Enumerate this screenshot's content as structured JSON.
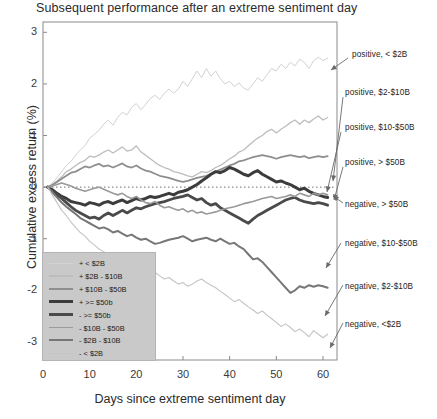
{
  "chart_data": {
    "type": "line",
    "title": "Subsequent performance after an extreme sentiment day",
    "xlabel": "Days since extreme sentiment day",
    "ylabel": "Cumulative excess return (%)",
    "xlim": [
      0,
      63
    ],
    "ylim": [
      -3.35,
      3.2
    ],
    "xticks": [
      0,
      10,
      20,
      30,
      40,
      50,
      60
    ],
    "xtick_labels": [
      "0",
      "10",
      "20",
      "30",
      "40",
      "50",
      "60"
    ],
    "yticks": [
      3,
      2,
      1,
      0,
      -1,
      -2,
      -3
    ],
    "ytick_labels": [
      "3",
      "2",
      "1",
      "0",
      "-1",
      "-2",
      "-3"
    ],
    "grid": false,
    "zero_reference_line": 0,
    "legend_position": "lower-left-inside",
    "x": [
      1,
      2,
      3,
      4,
      5,
      6,
      7,
      8,
      9,
      10,
      11,
      12,
      13,
      14,
      15,
      16,
      17,
      18,
      19,
      20,
      21,
      22,
      23,
      24,
      25,
      26,
      27,
      28,
      29,
      30,
      31,
      32,
      33,
      34,
      35,
      36,
      37,
      38,
      39,
      40,
      41,
      42,
      43,
      44,
      45,
      46,
      47,
      48,
      49,
      50,
      51,
      52,
      53,
      54,
      55,
      56,
      57,
      58,
      59,
      60,
      61
    ],
    "series": [
      {
        "name": "positive, < $2B",
        "legend_label": "+  < $2B",
        "color": "#d2d2d2",
        "width": 1.0,
        "sign": "positive",
        "bucket": "< $2B",
        "final_value": 2.5,
        "values": [
          0,
          0.08,
          0.18,
          0.3,
          0.42,
          0.5,
          0.62,
          0.72,
          0.8,
          0.95,
          1.02,
          1.1,
          1.22,
          1.3,
          1.2,
          1.35,
          1.45,
          1.4,
          1.55,
          1.62,
          1.5,
          1.6,
          1.72,
          1.78,
          1.7,
          1.82,
          1.9,
          1.82,
          1.9,
          2.05,
          1.95,
          2.1,
          2.25,
          2.12,
          2.3,
          2.15,
          2.25,
          2.1,
          2.0,
          2.05,
          1.95,
          2.02,
          1.92,
          1.88,
          2.0,
          2.12,
          2.05,
          2.18,
          2.3,
          2.25,
          2.38,
          2.3,
          2.42,
          2.35,
          2.48,
          2.42,
          2.3,
          2.45,
          2.52,
          2.45,
          2.5
        ]
      },
      {
        "name": "positive, $2-$10B",
        "legend_label": "+  $2B - $10B",
        "color": "#bdbdbd",
        "width": 1.3,
        "sign": "positive",
        "bucket": "$2B - $10B",
        "final_value": 1.35,
        "values": [
          0,
          0.05,
          0.12,
          0.2,
          0.3,
          0.35,
          0.42,
          0.48,
          0.52,
          0.6,
          0.58,
          0.62,
          0.68,
          0.72,
          0.66,
          0.72,
          0.78,
          0.7,
          0.72,
          0.8,
          0.68,
          0.62,
          0.55,
          0.48,
          0.42,
          0.38,
          0.35,
          0.3,
          0.28,
          0.25,
          0.22,
          0.2,
          0.25,
          0.3,
          0.28,
          0.32,
          0.38,
          0.42,
          0.48,
          0.55,
          0.6,
          0.68,
          0.72,
          0.8,
          0.88,
          0.95,
          1.0,
          1.08,
          1.12,
          1.05,
          1.12,
          1.18,
          1.25,
          1.3,
          1.22,
          1.3,
          1.25,
          1.32,
          1.38,
          1.3,
          1.35
        ]
      },
      {
        "name": "positive, $10-$50B",
        "legend_label": "+  $10B - $50B",
        "color": "#8e8e8e",
        "width": 1.8,
        "sign": "positive",
        "bucket": "$10B - $50B",
        "final_value": 0.6,
        "values": [
          0,
          0.04,
          0.1,
          0.16,
          0.22,
          0.28,
          0.3,
          0.35,
          0.4,
          0.38,
          0.42,
          0.45,
          0.4,
          0.42,
          0.38,
          0.42,
          0.46,
          0.4,
          0.38,
          0.42,
          0.36,
          0.32,
          0.3,
          0.26,
          0.22,
          0.2,
          0.18,
          0.15,
          0.12,
          0.1,
          0.12,
          0.15,
          0.18,
          0.2,
          0.22,
          0.26,
          0.3,
          0.34,
          0.38,
          0.42,
          0.45,
          0.5,
          0.52,
          0.55,
          0.58,
          0.6,
          0.62,
          0.6,
          0.58,
          0.55,
          0.58,
          0.6,
          0.62,
          0.6,
          0.58,
          0.6,
          0.56,
          0.58,
          0.6,
          0.58,
          0.6
        ]
      },
      {
        "name": "positive, > $50B",
        "legend_label": "+  >= $50b",
        "color": "#3c3c3c",
        "width": 3.0,
        "sign": "positive",
        "bucket": ">= $50b",
        "final_value": -0.2,
        "values": [
          0,
          -0.05,
          -0.12,
          -0.18,
          -0.22,
          -0.28,
          -0.3,
          -0.32,
          -0.35,
          -0.3,
          -0.32,
          -0.35,
          -0.3,
          -0.28,
          -0.32,
          -0.28,
          -0.25,
          -0.3,
          -0.26,
          -0.22,
          -0.25,
          -0.22,
          -0.18,
          -0.2,
          -0.18,
          -0.15,
          -0.12,
          -0.15,
          -0.1,
          -0.08,
          -0.05,
          0.0,
          0.05,
          0.12,
          0.18,
          0.25,
          0.3,
          0.28,
          0.32,
          0.38,
          0.35,
          0.3,
          0.25,
          0.22,
          0.28,
          0.32,
          0.25,
          0.2,
          0.15,
          0.1,
          0.12,
          0.08,
          0.05,
          0.0,
          -0.05,
          -0.02,
          -0.08,
          -0.12,
          -0.15,
          -0.18,
          -0.2
        ]
      },
      {
        "name": "negative, > $50B",
        "legend_label": "-  >= $50b",
        "color": "#4a4a4a",
        "width": 2.8,
        "sign": "negative",
        "bucket": ">= $50b",
        "final_value": -0.35,
        "values": [
          0,
          -0.08,
          -0.15,
          -0.22,
          -0.3,
          -0.38,
          -0.45,
          -0.5,
          -0.55,
          -0.6,
          -0.58,
          -0.62,
          -0.55,
          -0.5,
          -0.55,
          -0.5,
          -0.45,
          -0.5,
          -0.45,
          -0.4,
          -0.42,
          -0.38,
          -0.35,
          -0.32,
          -0.3,
          -0.28,
          -0.25,
          -0.22,
          -0.2,
          -0.18,
          -0.15,
          -0.2,
          -0.25,
          -0.22,
          -0.3,
          -0.35,
          -0.32,
          -0.4,
          -0.45,
          -0.5,
          -0.55,
          -0.6,
          -0.65,
          -0.7,
          -0.62,
          -0.55,
          -0.5,
          -0.45,
          -0.4,
          -0.35,
          -0.3,
          -0.25,
          -0.22,
          -0.2,
          -0.25,
          -0.28,
          -0.3,
          -0.32,
          -0.3,
          -0.32,
          -0.35
        ]
      },
      {
        "name": "negative, $10-$50B",
        "legend_label": "-  $10B - $50B",
        "color": "#9a9a9a",
        "width": 1.6,
        "sign": "negative",
        "bucket": "$10B - $50B",
        "final_value": -0.15,
        "values": [
          0,
          0.02,
          0.05,
          0.08,
          0.05,
          0.02,
          -0.02,
          -0.05,
          -0.08,
          -0.05,
          -0.02,
          0.0,
          -0.04,
          -0.08,
          -0.12,
          -0.15,
          -0.12,
          -0.18,
          -0.22,
          -0.18,
          -0.25,
          -0.3,
          -0.32,
          -0.28,
          -0.35,
          -0.4,
          -0.38,
          -0.42,
          -0.45,
          -0.42,
          -0.48,
          -0.45,
          -0.5,
          -0.48,
          -0.52,
          -0.5,
          -0.48,
          -0.45,
          -0.42,
          -0.4,
          -0.38,
          -0.35,
          -0.32,
          -0.3,
          -0.28,
          -0.25,
          -0.22,
          -0.2,
          -0.18,
          -0.22,
          -0.2,
          -0.18,
          -0.15,
          -0.18,
          -0.12,
          -0.15,
          -0.18,
          -0.12,
          -0.15,
          -0.12,
          -0.15
        ]
      },
      {
        "name": "negative, $2-$10B",
        "legend_label": "-  $2B - $10B",
        "color": "#777777",
        "width": 2.0,
        "sign": "negative",
        "bucket": "$2B - $10B",
        "final_value": -1.95,
        "values": [
          0,
          -0.1,
          -0.2,
          -0.3,
          -0.38,
          -0.45,
          -0.52,
          -0.6,
          -0.65,
          -0.7,
          -0.75,
          -0.8,
          -0.78,
          -0.82,
          -0.88,
          -0.85,
          -0.9,
          -0.95,
          -0.92,
          -0.98,
          -1.02,
          -1.0,
          -1.05,
          -1.1,
          -1.08,
          -1.05,
          -1.02,
          -1.0,
          -0.98,
          -0.95,
          -1.0,
          -1.05,
          -1.02,
          -1.0,
          -0.98,
          -1.02,
          -1.05,
          -1.0,
          -1.05,
          -1.1,
          -1.08,
          -1.15,
          -1.2,
          -1.3,
          -1.4,
          -1.38,
          -1.45,
          -1.55,
          -1.65,
          -1.75,
          -1.85,
          -1.95,
          -2.05,
          -2.0,
          -1.92,
          -1.95,
          -1.9,
          -1.93,
          -1.9,
          -1.92,
          -1.95
        ]
      },
      {
        "name": "negative, <$2B",
        "legend_label": "-  < $2B",
        "color": "#c4c4c4",
        "width": 1.1,
        "sign": "negative",
        "bucket": "< $2B",
        "final_value": -2.85,
        "values": [
          0,
          -0.15,
          -0.3,
          -0.45,
          -0.55,
          -0.68,
          -0.78,
          -0.88,
          -0.95,
          -1.05,
          -1.12,
          -1.2,
          -1.25,
          -1.3,
          -1.38,
          -1.42,
          -1.48,
          -1.45,
          -1.52,
          -1.58,
          -1.55,
          -1.62,
          -1.68,
          -1.65,
          -1.72,
          -1.78,
          -1.75,
          -1.82,
          -1.88,
          -1.85,
          -1.92,
          -1.88,
          -1.82,
          -1.78,
          -1.85,
          -1.9,
          -1.95,
          -2.02,
          -2.08,
          -2.15,
          -2.22,
          -2.18,
          -2.25,
          -2.32,
          -2.38,
          -2.45,
          -2.4,
          -2.48,
          -2.55,
          -2.62,
          -2.7,
          -2.65,
          -2.72,
          -2.8,
          -2.75,
          -2.82,
          -2.9,
          -2.78,
          -2.85,
          -2.92,
          -2.85
        ]
      }
    ],
    "annotations": [
      {
        "label": "positive, < $2B",
        "text_x": 352,
        "text_y": 55,
        "ax": 348,
        "ay": 58,
        "tx": 331,
        "ty": 70
      },
      {
        "label": "positive, $2-$10B",
        "text_x": 345,
        "text_y": 93,
        "ax": 343,
        "ay": 97,
        "tx": 333,
        "ty": 181
      },
      {
        "label": "positive, $10-$50B",
        "text_x": 345,
        "text_y": 128,
        "ax": 341,
        "ay": 132,
        "tx": 327,
        "ty": 192
      },
      {
        "label": "positive, > $50B",
        "text_x": 345,
        "text_y": 163,
        "ax": 343,
        "ay": 167,
        "tx": 334,
        "ty": 200
      },
      {
        "label": "negative, > $50B",
        "text_x": 345,
        "text_y": 205,
        "ax": 343,
        "ay": 203,
        "tx": 333,
        "ty": 196
      },
      {
        "label": "negative, $10-$50B",
        "text_x": 345,
        "text_y": 244,
        "ax": 341,
        "ay": 243,
        "tx": 326,
        "ty": 268
      },
      {
        "label": "negative, $2-$10B",
        "text_x": 345,
        "text_y": 287,
        "ax": 343,
        "ay": 285,
        "tx": 325,
        "ty": 316
      },
      {
        "label": "negative, <$2B",
        "text_x": 345,
        "text_y": 325,
        "ax": 343,
        "ay": 323,
        "tx": 330,
        "ty": 348
      }
    ]
  }
}
